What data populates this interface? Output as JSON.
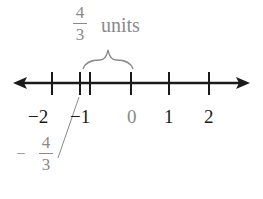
{
  "diagram": {
    "type": "number-line",
    "annotation": {
      "numerator": "4",
      "denominator": "3",
      "unit_label": "units"
    },
    "ticks": [
      {
        "value": -2,
        "label": "−2"
      },
      {
        "value": -1.3333,
        "label_sign": "−",
        "label_num": "4",
        "label_den": "3"
      },
      {
        "value": -1,
        "label": "−1"
      },
      {
        "value": 0,
        "label": "0"
      },
      {
        "value": 1,
        "label": "1"
      },
      {
        "value": 2,
        "label": "2"
      }
    ],
    "colors": {
      "axis": "#1a1a1a",
      "annotation": "#8a8a8a"
    }
  }
}
